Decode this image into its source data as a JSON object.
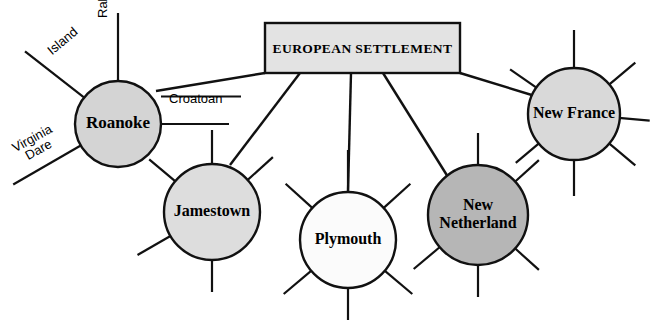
{
  "diagram": {
    "title_box": {
      "label": "EUROPEAN SETTLEMENT",
      "fill": "#e3e3e3",
      "stroke": "#111111",
      "x": 265,
      "y": 23,
      "width": 195,
      "height": 50
    },
    "nodes": [
      {
        "id": "roanoke",
        "label": "Roanoke",
        "label_lines": [
          "Roanoke"
        ],
        "cx": 118,
        "cy": 124,
        "r": 43,
        "fill": "#d4d4d4",
        "font_size": 17
      },
      {
        "id": "jamestown",
        "label": "Jamestown",
        "label_lines": [
          "Jamestown"
        ],
        "cx": 212,
        "cy": 212,
        "r": 48,
        "fill": "#dddddd",
        "font_size": 16
      },
      {
        "id": "plymouth",
        "label": "Plymouth",
        "label_lines": [
          "Plymouth"
        ],
        "cx": 348,
        "cy": 240,
        "r": 48,
        "fill": "#fbfbfb",
        "font_size": 16
      },
      {
        "id": "new-netherland",
        "label": "New Netherland",
        "label_lines": [
          "New",
          "Netherland"
        ],
        "cx": 478,
        "cy": 215,
        "r": 50,
        "fill": "#b6b6b6",
        "font_size": 16
      },
      {
        "id": "new-france",
        "label": "New France",
        "label_lines": [
          "New France"
        ],
        "cx": 574,
        "cy": 114,
        "r": 46,
        "fill": "#d9d9d9",
        "font_size": 16
      }
    ],
    "connectors": [
      {
        "id": "box-to-roanoke",
        "from": "european-settlement",
        "to": "roanoke",
        "x1": 265,
        "y1": 73,
        "x2": 156,
        "y2": 91
      },
      {
        "id": "box-to-jamestown",
        "from": "european-settlement",
        "to": "jamestown",
        "x1": 300,
        "y1": 73,
        "x2": 230,
        "y2": 165
      },
      {
        "id": "box-to-plymouth",
        "from": "european-settlement",
        "to": "plymouth",
        "x1": 351,
        "y1": 73,
        "x2": 348,
        "y2": 192
      },
      {
        "id": "box-to-new-netherland",
        "from": "european-settlement",
        "to": "new-netherland",
        "x1": 383,
        "y1": 73,
        "x2": 448,
        "y2": 177
      },
      {
        "id": "box-to-new-france",
        "from": "european-settlement",
        "to": "new-france",
        "x1": 460,
        "y1": 73,
        "x2": 535,
        "y2": 96
      }
    ],
    "edge_labels": [
      {
        "id": "raleigh",
        "text": "Raleigh",
        "rotation": -90,
        "x": 96,
        "y": 18
      },
      {
        "id": "island",
        "text": "Island",
        "rotation": -40,
        "x": 45,
        "y": 47
      },
      {
        "id": "virginia-dare",
        "text": "Virginia\nDare",
        "line1": "Virginia",
        "line2": "Dare",
        "rotation": -29,
        "x": 10,
        "y": 143
      },
      {
        "id": "croatoan",
        "text": "Croatoan",
        "rotation": 0,
        "x": 169,
        "y": 92
      }
    ],
    "spokes": {
      "roanoke": [
        {
          "id": "roanoke-raleigh",
          "angle": -90,
          "length": 68,
          "label": "Raleigh"
        },
        {
          "id": "roanoke-island",
          "angle": -142,
          "length": 75,
          "label": "Island"
        },
        {
          "id": "roanoke-croatoan",
          "angle": 0,
          "length": 68,
          "label": "Croatoan"
        },
        {
          "id": "roanoke-virginia-dare",
          "angle": 150,
          "length": 78,
          "label": "Virginia Dare"
        }
      ],
      "jamestown": [
        {
          "id": "jamestown-n",
          "angle": -90,
          "length": 34,
          "label": ""
        },
        {
          "id": "jamestown-ne",
          "angle": -42,
          "length": 34,
          "label": ""
        },
        {
          "id": "jamestown-nw",
          "angle": -140,
          "length": 34,
          "label": ""
        },
        {
          "id": "jamestown-sw",
          "angle": 150,
          "length": 38,
          "label": ""
        },
        {
          "id": "jamestown-s",
          "angle": 90,
          "length": 32,
          "label": ""
        }
      ],
      "plymouth": [
        {
          "id": "plymouth-n",
          "angle": -90,
          "length": 42,
          "label": ""
        },
        {
          "id": "plymouth-ne",
          "angle": -42,
          "length": 36,
          "label": ""
        },
        {
          "id": "plymouth-nw",
          "angle": -138,
          "length": 36,
          "label": ""
        },
        {
          "id": "plymouth-se",
          "angle": 40,
          "length": 36,
          "label": ""
        },
        {
          "id": "plymouth-sw",
          "angle": 140,
          "length": 36,
          "label": ""
        },
        {
          "id": "plymouth-s",
          "angle": 90,
          "length": 32,
          "label": ""
        }
      ],
      "new_netherland": [
        {
          "id": "new-netherland-n",
          "angle": -90,
          "length": 32,
          "label": ""
        },
        {
          "id": "new-netherland-ne",
          "angle": -42,
          "length": 32,
          "label": ""
        },
        {
          "id": "new-netherland-se",
          "angle": 42,
          "length": 32,
          "label": ""
        },
        {
          "id": "new-netherland-sw",
          "angle": 140,
          "length": 34,
          "label": ""
        },
        {
          "id": "new-netherland-s",
          "angle": 90,
          "length": 32,
          "label": ""
        }
      ],
      "new_france": [
        {
          "id": "new-france-n",
          "angle": -90,
          "length": 38,
          "label": ""
        },
        {
          "id": "new-france-nw",
          "angle": -145,
          "length": 32,
          "label": ""
        },
        {
          "id": "new-france-ne",
          "angle": -40,
          "length": 34,
          "label": ""
        },
        {
          "id": "new-france-e",
          "angle": 5,
          "length": 30,
          "label": ""
        },
        {
          "id": "new-france-se",
          "angle": 40,
          "length": 34,
          "label": ""
        },
        {
          "id": "new-france-s",
          "angle": 90,
          "length": 36,
          "label": ""
        },
        {
          "id": "new-france-sw",
          "angle": 140,
          "length": 30,
          "label": ""
        }
      ]
    },
    "colors": {
      "line": "#111111",
      "box_fill": "#e3e3e3",
      "background": "#ffffff"
    }
  }
}
